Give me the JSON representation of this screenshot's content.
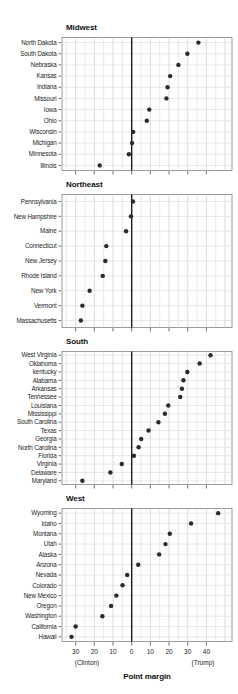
{
  "chart_data": {
    "type": "scatter",
    "subtype": "dot-plot",
    "title": "",
    "xlabel": "Point margin",
    "ylabel": "",
    "xlim": [
      -37.3,
      53.7
    ],
    "grid": "on",
    "grid_step_minor": 5,
    "x_ticks": [
      -30,
      -20,
      -10,
      0,
      10,
      20,
      30,
      40
    ],
    "x_tick_labels": [
      "30",
      "20",
      "10",
      "0",
      "10",
      "20",
      "30",
      "40"
    ],
    "zero_reference_line": 0,
    "annotations": {
      "left": "(Clinton)",
      "right": "(Trump)"
    },
    "colors": {
      "dot": "#2b2b2b",
      "zero_line": "#1a1a1a",
      "grid_major": "#cccccc",
      "grid_minor": "#dedede",
      "border": "#909090",
      "tick": "#4d4d4d",
      "text": "#262626"
    },
    "panels": [
      {
        "title": "Midwest",
        "states": [
          "North Dakota",
          "South Dakota",
          "Nebraska",
          "Kansas",
          "Indiana",
          "Missouri",
          "Iowa",
          "Ohio",
          "Wisconsin",
          "Michigan",
          "Minnesota",
          "Illinois"
        ],
        "values": [
          35.7,
          29.8,
          25.0,
          20.6,
          19.2,
          18.6,
          9.4,
          8.1,
          0.8,
          0.2,
          -1.5,
          -17.1
        ]
      },
      {
        "title": "Northeast",
        "states": [
          "Pennsylvania",
          "New Hampshire",
          "Maine",
          "Connecticut",
          "New Jersey",
          "Rhode Island",
          "New York",
          "Vermont",
          "Massachusetts"
        ],
        "values": [
          0.7,
          -0.4,
          -3.0,
          -13.6,
          -14.1,
          -15.5,
          -22.5,
          -26.4,
          -27.2
        ]
      },
      {
        "title": "South",
        "states": [
          "West Virginia",
          "Oklahoma",
          "kentucky",
          "Alabama",
          "Arkansas",
          "Tennessee",
          "Louisiana",
          "Mississippi",
          "South Carolina",
          "Texas",
          "Georgia",
          "North Carolina",
          "Florida",
          "Virginia",
          "Delaware",
          "Maryland"
        ],
        "values": [
          42.2,
          36.4,
          29.8,
          27.7,
          26.9,
          26.0,
          19.6,
          17.8,
          14.3,
          9.0,
          5.1,
          3.7,
          1.2,
          -5.3,
          -11.4,
          -26.4
        ]
      },
      {
        "title": "West",
        "states": [
          "Wyoming",
          "Idaho",
          "Montana",
          "Utah",
          "Alaska",
          "Arizona",
          "Nevada",
          "Colorado",
          "New Mexico",
          "Oregon",
          "Washington",
          "California",
          "Hawaii"
        ],
        "values": [
          46.3,
          31.8,
          20.4,
          18.1,
          14.7,
          3.5,
          -2.4,
          -4.9,
          -8.2,
          -11.0,
          -15.7,
          -30.0,
          -32.2
        ]
      }
    ]
  }
}
